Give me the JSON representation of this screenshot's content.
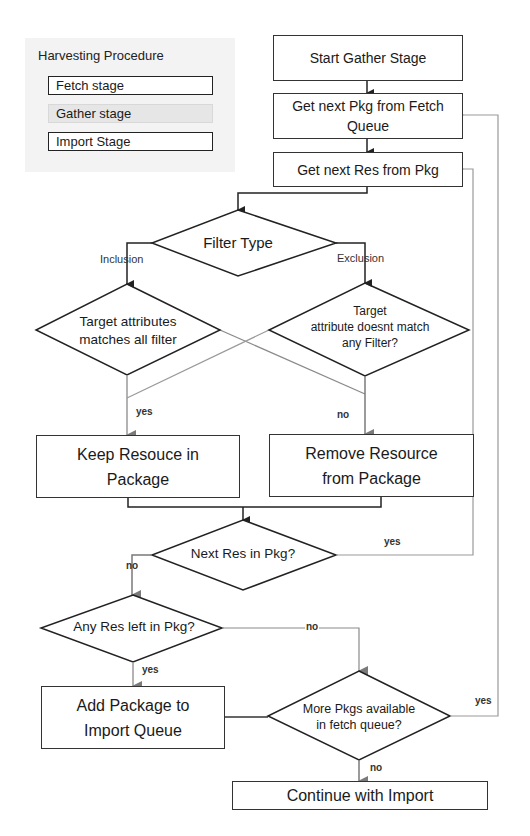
{
  "legend": {
    "title": "Harvesting Procedure",
    "items": [
      {
        "label": "Fetch stage",
        "active": false
      },
      {
        "label": "Gather stage",
        "active": true
      },
      {
        "label": "Import Stage",
        "active": false
      }
    ]
  },
  "nodes": {
    "start": "Start Gather Stage",
    "get_pkg": "Get next Pkg from Fetch\nQueue",
    "get_res": "Get next Res from Pkg",
    "filter_type": "Filter Type",
    "inclusion_check": "Target attributes\nmatches all filter",
    "exclusion_check": "Target\nattribute doesnt match\nany Filter?",
    "keep": "Keep Resouce in\nPackage",
    "remove": "Remove Resource\nfrom Package",
    "next_res": "Next Res in Pkg?",
    "any_left": "Any Res left in Pkg?",
    "add_pkg": "Add Package to\nImport Queue",
    "more_pkgs": "More Pkgs available\nin fetch queue?",
    "continue": "Continue with Import"
  },
  "edge_labels": {
    "inclusion": "Inclusion",
    "exclusion": "Exclusion",
    "yes_keep": "yes",
    "no_remove": "no",
    "yes_next_res": "yes",
    "no_next_res": "no",
    "no_any_left": "no",
    "yes_any_left": "yes",
    "yes_more_pkgs": "yes",
    "no_more_pkgs": "no"
  },
  "colors": {
    "line_dark": "#222222",
    "line_grey": "#8a8a8a",
    "legend_bg": "#f3f3f3",
    "legend_active": "#e6e6e6"
  }
}
